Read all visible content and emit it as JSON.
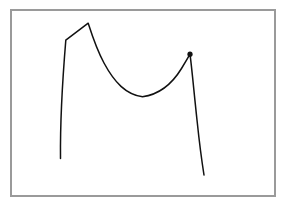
{
  "figure": {
    "kind": "line-drawing",
    "background_color": "#ffffff",
    "canvas": {
      "width": 283,
      "height": 208
    }
  },
  "frame": {
    "name": "border-rectangle",
    "x": 11,
    "y": 10,
    "width": 264,
    "height": 186,
    "stroke_color": "#9a9a9a",
    "stroke_width": 1.2,
    "fill": "none"
  },
  "curve": {
    "name": "m-shaped-curve",
    "stroke_color": "#111111",
    "stroke_width": 1.5,
    "fill": "none",
    "path": "M 60.5 158.5 C 60.2 130 62.5 80 65.8 40.2 L 88.2 23.2 C 91.5 33.5 96.0 48.0 104.0 63.0 C 114.5 82.5 126.0 94.5 142.5 96.8 C 159.0 94.5 172.0 84.0 181.5 68.5 C 185.5 62.0 188.3 57.2 190.0 54.2 C 191.6 66.0 194.0 92.0 197.0 120.0 C 199.2 141.0 201.6 160.0 204.0 175.0",
    "points": {
      "left_tail_bottom": {
        "x": 60.5,
        "y": 158.5
      },
      "left_shoulder_kink": {
        "x": 65.8,
        "y": 40.2
      },
      "left_apex": {
        "x": 88.2,
        "y": 23.2
      },
      "valley_bottom": {
        "x": 142.5,
        "y": 96.8
      },
      "right_peak": {
        "x": 190.0,
        "y": 54.2
      },
      "right_tail_end": {
        "x": 204.0,
        "y": 175.0
      }
    }
  },
  "peak_marker": {
    "name": "right-peak-dot",
    "cx": 190.0,
    "cy": 54.2,
    "r": 2.6,
    "fill_color": "#111111"
  },
  "chart_data": {
    "type": "line",
    "title": "",
    "xlabel": "",
    "ylabel": "",
    "grid": false,
    "legend": null,
    "axis_visible": false,
    "xlim": [
      11,
      275
    ],
    "ylim": [
      196,
      10
    ],
    "series": [
      {
        "name": "sketch-curve",
        "x": [
          60.5,
          65.8,
          88.2,
          104.0,
          122.0,
          142.5,
          163.0,
          181.5,
          190.0,
          197.0,
          204.0
        ],
        "y": [
          158.5,
          40.2,
          23.2,
          63.0,
          88.0,
          96.8,
          90.0,
          68.5,
          54.2,
          120.0,
          175.0
        ]
      }
    ],
    "annotations": [
      {
        "type": "point-marker",
        "x": 190.0,
        "y": 54.2,
        "label": ""
      }
    ]
  }
}
